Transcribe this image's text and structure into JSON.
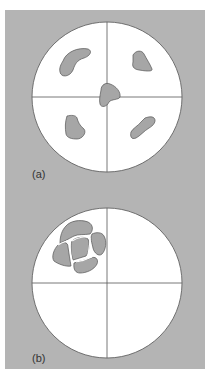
{
  "figure": {
    "panels": [
      {
        "label": "(a)",
        "description": "Five separate grey regions distributed across four quadrants and center"
      },
      {
        "label": "(b)",
        "description": "Grey regions clustered together in upper-left quadrant"
      }
    ],
    "colors": {
      "background": "#b4b4b4",
      "circle": "#ffffff",
      "blob": "#a6a6a6",
      "line": "#555555"
    }
  }
}
